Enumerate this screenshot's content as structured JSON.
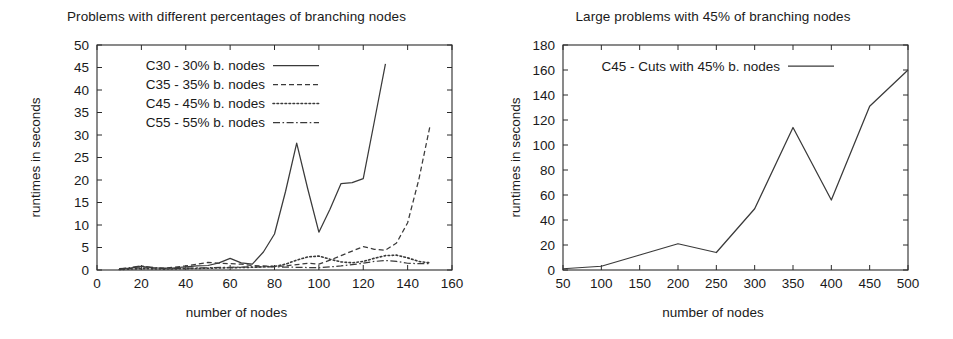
{
  "figure": {
    "background": "#ffffff",
    "line_color": "#3a3a3a",
    "axis_color": "#2b2b2b"
  },
  "panels": [
    {
      "id": "left",
      "title": "Problems with different percentages of branching nodes",
      "xlabel": "number of nodes",
      "ylabel": "runtimes in seconds"
    },
    {
      "id": "right",
      "title": "Large problems with 45% of branching nodes",
      "xlabel": "number of nodes",
      "ylabel": "runtimes in seconds"
    }
  ],
  "chart_data": [
    {
      "type": "line",
      "title": "Problems with different percentages of branching nodes",
      "xlabel": "number of nodes",
      "ylabel": "runtimes in seconds",
      "xlim": [
        0,
        160
      ],
      "ylim": [
        0,
        50
      ],
      "xticks": [
        0,
        20,
        40,
        60,
        80,
        100,
        120,
        140,
        160
      ],
      "yticks": [
        0,
        5,
        10,
        15,
        20,
        25,
        30,
        35,
        40,
        45,
        50
      ],
      "grid": false,
      "legend_position": "top-left-inside",
      "series": [
        {
          "name": "C30 - 30% b. nodes",
          "dash": "solid",
          "x": [
            10,
            15,
            20,
            25,
            30,
            35,
            40,
            45,
            50,
            55,
            60,
            65,
            70,
            75,
            80,
            85,
            90,
            95,
            100,
            105,
            110,
            115,
            120,
            125,
            130
          ],
          "y": [
            0.3,
            0.4,
            0.8,
            0.5,
            0.4,
            0.5,
            0.7,
            0.9,
            1.0,
            1.6,
            2.6,
            1.6,
            1.3,
            4.0,
            8.0,
            17.5,
            28.2,
            18.0,
            8.4,
            13.5,
            19.2,
            19.4,
            20.3,
            33.0,
            45.8
          ]
        },
        {
          "name": "C35 - 35% b. nodes",
          "dash": "dashed",
          "x": [
            10,
            20,
            30,
            40,
            45,
            50,
            55,
            60,
            65,
            70,
            75,
            80,
            85,
            90,
            95,
            100,
            105,
            110,
            115,
            120,
            125,
            130,
            135,
            140,
            145,
            150
          ],
          "y": [
            0.2,
            0.5,
            0.4,
            0.9,
            1.3,
            1.7,
            1.5,
            1.4,
            1.3,
            1.0,
            0.9,
            0.8,
            0.9,
            1.2,
            1.5,
            1.3,
            2.2,
            3.2,
            4.2,
            5.2,
            4.6,
            4.4,
            6.0,
            10.5,
            20.0,
            31.8
          ]
        },
        {
          "name": "C45 - 45% b. nodes",
          "dash": "dotted",
          "x": [
            10,
            20,
            30,
            40,
            50,
            60,
            70,
            80,
            85,
            90,
            95,
            100,
            105,
            110,
            115,
            120,
            125,
            130,
            135,
            140,
            145,
            150
          ],
          "y": [
            0.1,
            0.3,
            0.2,
            0.3,
            0.4,
            0.5,
            0.6,
            0.8,
            1.3,
            2.2,
            2.9,
            3.1,
            2.4,
            1.8,
            1.6,
            1.9,
            2.6,
            3.2,
            3.3,
            2.7,
            1.9,
            1.6
          ]
        },
        {
          "name": "C55 - 55% b. nodes",
          "dash": "dashdot",
          "x": [
            10,
            20,
            30,
            40,
            50,
            60,
            70,
            80,
            90,
            100,
            105,
            110,
            115,
            120,
            125,
            130,
            135,
            140,
            145,
            150
          ],
          "y": [
            0.2,
            0.9,
            0.3,
            0.4,
            0.5,
            0.6,
            0.7,
            0.7,
            0.6,
            0.5,
            0.7,
            0.9,
            1.2,
            1.5,
            1.9,
            2.1,
            1.9,
            1.5,
            1.4,
            1.4
          ]
        }
      ]
    },
    {
      "type": "line",
      "title": "Large problems with 45% of branching nodes",
      "xlabel": "number of nodes",
      "ylabel": "runtimes in seconds",
      "xlim": [
        50,
        500
      ],
      "ylim": [
        0,
        180
      ],
      "xticks": [
        50,
        100,
        150,
        200,
        250,
        300,
        350,
        400,
        450,
        500
      ],
      "yticks": [
        0,
        20,
        40,
        60,
        80,
        100,
        120,
        140,
        160,
        180
      ],
      "grid": false,
      "legend_position": "top-center-inside",
      "series": [
        {
          "name": "C45 - Cuts with 45% b. nodes",
          "dash": "solid",
          "x": [
            50,
            100,
            150,
            200,
            250,
            300,
            350,
            400,
            450,
            500
          ],
          "y": [
            1,
            3,
            12,
            21,
            14,
            49,
            114,
            56,
            131,
            160
          ]
        }
      ]
    }
  ]
}
